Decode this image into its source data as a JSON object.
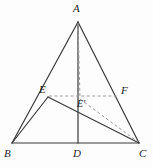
{
  "figure": {
    "type": "geometry-diagram",
    "canvas": {
      "width": 153,
      "height": 167
    },
    "colors": {
      "background": "#fdfdfd",
      "solid_stroke": "#3a3a3a",
      "dashed_stroke": "#9a9a9a",
      "label_color": "#1d1d1d"
    },
    "points": [
      {
        "id": "A",
        "label": "A",
        "x": 78,
        "y": 22,
        "label_x": 73,
        "label_y": 3
      },
      {
        "id": "B",
        "label": "B",
        "x": 12,
        "y": 143,
        "label_x": 4,
        "label_y": 148
      },
      {
        "id": "C",
        "label": "C",
        "x": 139,
        "y": 143,
        "label_x": 140,
        "label_y": 148
      },
      {
        "id": "D",
        "label": "D",
        "x": 78,
        "y": 143,
        "label_x": 73,
        "label_y": 148
      },
      {
        "id": "E",
        "label": "E",
        "x": 48,
        "y": 97,
        "label_x": 39,
        "label_y": 84
      },
      {
        "id": "F",
        "label": "F",
        "x": 118,
        "y": 97,
        "label_x": 122,
        "label_y": 86
      },
      {
        "id": "Ep",
        "label": "E'",
        "x": 80,
        "y": 99,
        "label_x": 78,
        "label_y": 99
      }
    ],
    "solid_segments": [
      {
        "name": "segment-AB",
        "from": "A",
        "to": "B"
      },
      {
        "name": "segment-AC",
        "from": "A",
        "to": "C"
      },
      {
        "name": "segment-BC",
        "from": "B",
        "to": "C"
      },
      {
        "name": "segment-AD",
        "from": "A",
        "to": "D"
      },
      {
        "name": "segment-BE",
        "from": "B",
        "to": "E"
      },
      {
        "name": "segment-EC",
        "from": "E",
        "to": "C"
      },
      {
        "name": "segment-AE-upper",
        "from": "A",
        "to": "E"
      }
    ],
    "dashed_segments": [
      {
        "name": "segment-EF-dashed",
        "from": "E",
        "to": "F"
      },
      {
        "name": "segment-AEp-dashed",
        "from": "A",
        "to": "Ep"
      },
      {
        "name": "segment-EpC-dashed",
        "from": "Ep",
        "to": "C"
      },
      {
        "name": "segment-FC-dashed",
        "from": "F",
        "to": "C"
      }
    ]
  }
}
